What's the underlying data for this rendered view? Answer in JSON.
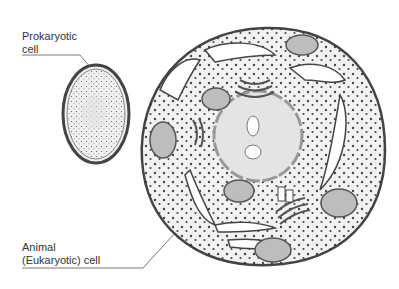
{
  "diagram": {
    "labels": {
      "prokaryotic_line1": "Prokaryotic",
      "prokaryotic_line2": "cell",
      "animal_line1": "Animal",
      "animal_line2": "(Eukaryotic) cell"
    },
    "colors": {
      "outline": "#444444",
      "cytoplasm": "#f2f2f2",
      "organelle_fill": "#bdbdbd",
      "nucleus_fill": "#e4e4e4",
      "dots": "#333333"
    }
  }
}
